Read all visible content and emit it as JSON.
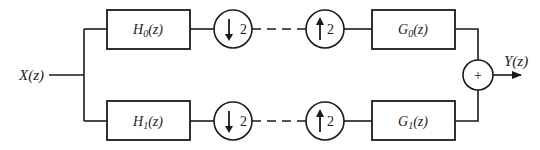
{
  "diagram": {
    "input": {
      "label": "X(z)"
    },
    "output": {
      "label": "Y(z)"
    },
    "channels": [
      {
        "analysis_filter": {
          "label": "H",
          "sub": "0",
          "arg": "(z)"
        },
        "downsampler": {
          "factor": "2"
        },
        "upsampler": {
          "factor": "2"
        },
        "synthesis_filter": {
          "label": "G",
          "sub": "0",
          "arg": "(z)"
        }
      },
      {
        "analysis_filter": {
          "label": "H",
          "sub": "1",
          "arg": "(z)"
        },
        "downsampler": {
          "factor": "2"
        },
        "upsampler": {
          "factor": "2"
        },
        "synthesis_filter": {
          "label": "G",
          "sub": "1",
          "arg": "(z)"
        }
      }
    ],
    "summer": {
      "symbol": "+"
    }
  },
  "colors": {
    "stroke": "#1a1a1a",
    "background": "#ffffff"
  }
}
